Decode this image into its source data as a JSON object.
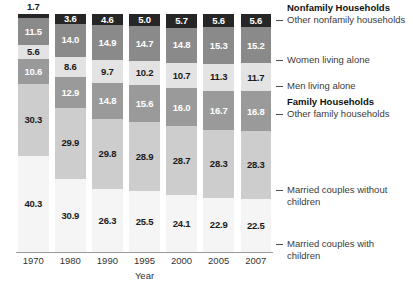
{
  "chart_data": {
    "type": "bar",
    "variant": "stacked-100-percent",
    "title": "",
    "xlabel": "Year",
    "ylabel": "",
    "ylim": [
      0,
      100
    ],
    "grid": false,
    "legend_position": "right",
    "categories": [
      "1970",
      "1980",
      "1990",
      "1995",
      "2000",
      "2005",
      "2007"
    ],
    "series": [
      {
        "name": "Married couples with children",
        "group": "Family Households",
        "color": "#f5f5f5",
        "values": [
          40.3,
          30.9,
          26.3,
          25.5,
          24.1,
          22.9,
          22.5
        ]
      },
      {
        "name": "Married couples without children",
        "group": "Family Households",
        "color": "#cdcdcd",
        "values": [
          30.3,
          29.9,
          29.8,
          28.9,
          28.7,
          28.3,
          28.3
        ]
      },
      {
        "name": "Other family households",
        "group": "Family Households",
        "color": "#9a9a9a",
        "values": [
          10.6,
          12.9,
          14.8,
          15.6,
          16.0,
          16.7,
          16.8
        ]
      },
      {
        "name": "Men living alone",
        "group": "Nonfamily Households",
        "color": "#e3e3e3",
        "values": [
          5.6,
          8.6,
          9.7,
          10.2,
          10.7,
          11.3,
          11.7
        ]
      },
      {
        "name": "Women living alone",
        "group": "Nonfamily Households",
        "color": "#8a8a8a",
        "values": [
          11.5,
          14.0,
          14.9,
          14.7,
          14.8,
          15.3,
          15.2
        ]
      },
      {
        "name": "Other nonfamily households",
        "group": "Nonfamily Households",
        "color": "#262626",
        "values": [
          1.7,
          3.6,
          4.6,
          5.0,
          5.7,
          5.6,
          5.6
        ]
      }
    ]
  },
  "legend": {
    "headings": [
      {
        "label": "Nonfamily Households"
      },
      {
        "label": "Family Households"
      }
    ],
    "entries": [
      {
        "label": "Other nonfamily households"
      },
      {
        "label": "Women living alone"
      },
      {
        "label": "Men living alone"
      },
      {
        "label": "Other family households"
      },
      {
        "label": "Married couples without children"
      },
      {
        "label": "Married couples with children"
      }
    ]
  },
  "axis": {
    "x_title": "Year",
    "x_ticks": [
      "1970",
      "1980",
      "1990",
      "1995",
      "2000",
      "2005",
      "2007"
    ]
  }
}
